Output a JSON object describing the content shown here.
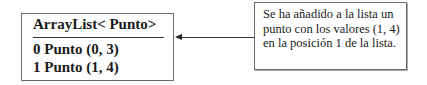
{
  "list_box": {
    "title": "ArrayList< Punto>",
    "items": [
      {
        "label": "0 Punto (0, 3)"
      },
      {
        "label": "1 Punto (1, 4)"
      }
    ]
  },
  "note": {
    "text": "Se ha añadido a la lista un punto con los valores (1, 4) en la posición 1 de la lista."
  },
  "colors": {
    "border": "#6b6b6b",
    "text": "#1a1a1a",
    "background": "#ffffff"
  }
}
